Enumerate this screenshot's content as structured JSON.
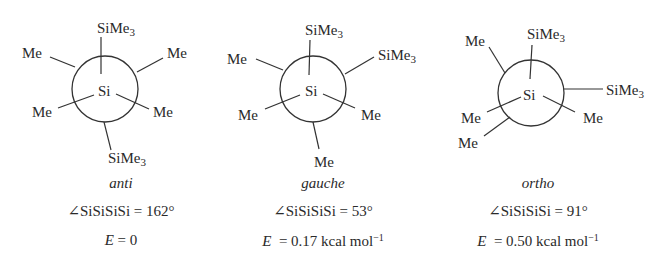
{
  "figure": {
    "type": "newman-projections",
    "center_atom": "Si",
    "conformers": [
      {
        "name": "anti",
        "front_substituents": [
          "SiMe3",
          "Me",
          "Me"
        ],
        "back_substituents": [
          "SiMe3",
          "Me",
          "Me"
        ],
        "labels": {
          "top": "SiMe",
          "top_sub": "3",
          "upper_left": "Me",
          "upper_right": "Me",
          "lower_left": "Me",
          "lower_right": "Me",
          "bottom": "SiMe",
          "bottom_sub": "3"
        },
        "angle_label": "∠SiSiSiSi = 162°",
        "energy_symbol": "E",
        "energy_value": " = 0"
      },
      {
        "name": "gauche",
        "labels": {
          "top": "SiMe",
          "top_sub": "3",
          "upper_left": "Me",
          "upper_right": "SiMe",
          "upper_right_sub": "3",
          "lower_left": "Me",
          "lower_right": "Me",
          "bottom": "Me"
        },
        "angle_label": "∠SiSiSiSi = 53°",
        "energy_symbol": "E",
        "energy_value": "  = 0.17 kcal mol",
        "energy_exp": "−1"
      },
      {
        "name": "ortho",
        "labels": {
          "top": "SiMe",
          "top_sub": "3",
          "upper_left": "Me",
          "right": "SiMe",
          "right_sub": "3",
          "lower_left": "Me",
          "lower_left2": "Me",
          "lower_right": "Me"
        },
        "angle_label": "∠SiSiSiSi = 91°",
        "energy_symbol": "E",
        "energy_value": "  = 0.50 kcal mol",
        "energy_exp": "−1"
      }
    ]
  }
}
